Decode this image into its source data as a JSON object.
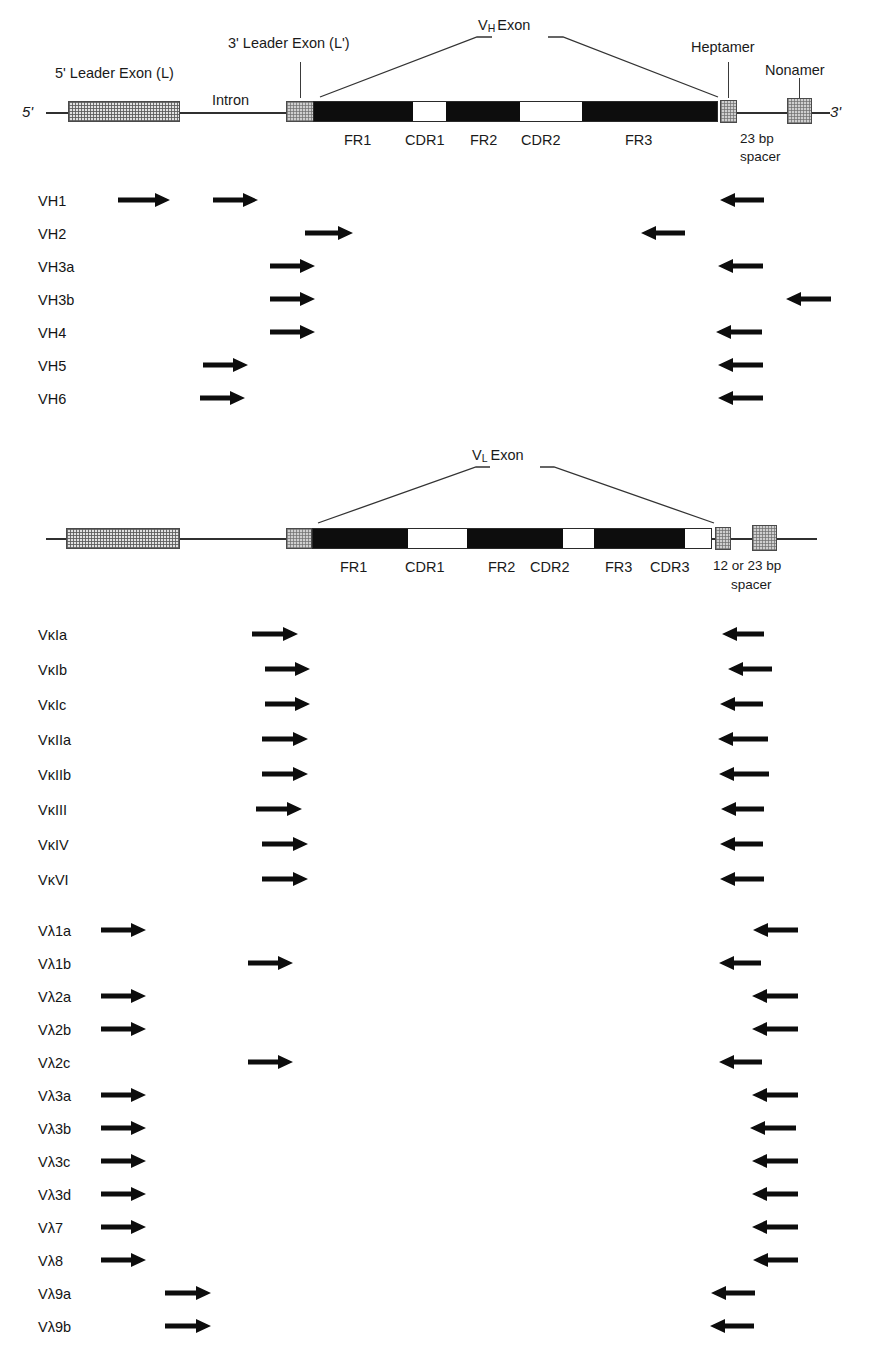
{
  "figure": {
    "ink_color": "#0d0d0d",
    "box_fill": "#d8d8d8"
  },
  "heavy_map": {
    "five_prime_label": "5'",
    "three_prime_label": "3'",
    "leader_exon_label": "5' Leader Exon (L)",
    "intron_label": "Intron",
    "leader_exon2_label": "3' Leader Exon (L')",
    "exon_label_v": "V",
    "exon_label_sub": "H",
    "exon_label_exon": "Exon",
    "heptamer_label": "Heptamer",
    "nonamer_label": "Nonamer",
    "spacer_label_line1": "23 bp",
    "spacer_label_line2": "spacer",
    "segments": [
      "FR1",
      "CDR1",
      "FR2",
      "CDR2",
      "FR3"
    ]
  },
  "light_map": {
    "exon_label_v": "V",
    "exon_label_sub": "L",
    "exon_label_exon": "Exon",
    "spacer_label_line1": "12 or 23 bp",
    "spacer_label_line2": "spacer",
    "segments": [
      "FR1",
      "CDR1",
      "FR2",
      "CDR2",
      "FR3",
      "CDR3"
    ]
  },
  "primer_groups": [
    {
      "name": "heavy-chain-primers",
      "rows": [
        {
          "label": "VH1",
          "forward": [
            {
              "x": 118,
              "w": 52
            },
            {
              "x": 213,
              "w": 45
            }
          ],
          "reverse": [
            {
              "x": 720,
              "w": 44
            }
          ]
        },
        {
          "label": "VH2",
          "forward": [
            {
              "x": 305,
              "w": 48
            }
          ],
          "reverse": [
            {
              "x": 641,
              "w": 44
            }
          ]
        },
        {
          "label": "VH3a",
          "forward": [
            {
              "x": 270,
              "w": 45
            }
          ],
          "reverse": [
            {
              "x": 718,
              "w": 45
            }
          ]
        },
        {
          "label": "VH3b",
          "forward": [
            {
              "x": 270,
              "w": 45
            }
          ],
          "reverse": [
            {
              "x": 786,
              "w": 45
            }
          ]
        },
        {
          "label": "VH4",
          "forward": [
            {
              "x": 270,
              "w": 45
            }
          ],
          "reverse": [
            {
              "x": 716,
              "w": 46
            }
          ]
        },
        {
          "label": "VH5",
          "forward": [
            {
              "x": 203,
              "w": 45
            }
          ],
          "reverse": [
            {
              "x": 718,
              "w": 45
            }
          ]
        },
        {
          "label": "VH6",
          "forward": [
            {
              "x": 200,
              "w": 45
            }
          ],
          "reverse": [
            {
              "x": 718,
              "w": 45
            }
          ]
        }
      ]
    },
    {
      "name": "kappa-chain-primers",
      "rows": [
        {
          "label": "VκIa",
          "forward": [
            {
              "x": 252,
              "w": 46
            }
          ],
          "reverse": [
            {
              "x": 722,
              "w": 42
            }
          ]
        },
        {
          "label": "VκIb",
          "forward": [
            {
              "x": 265,
              "w": 45
            }
          ],
          "reverse": [
            {
              "x": 728,
              "w": 44
            }
          ]
        },
        {
          "label": "VκIc",
          "forward": [
            {
              "x": 265,
              "w": 45
            }
          ],
          "reverse": [
            {
              "x": 720,
              "w": 43
            }
          ]
        },
        {
          "label": "VκIIa",
          "forward": [
            {
              "x": 262,
              "w": 46
            }
          ],
          "reverse": [
            {
              "x": 718,
              "w": 50
            }
          ]
        },
        {
          "label": "VκIIb",
          "forward": [
            {
              "x": 262,
              "w": 46
            }
          ],
          "reverse": [
            {
              "x": 719,
              "w": 50
            }
          ]
        },
        {
          "label": "VκIII",
          "forward": [
            {
              "x": 256,
              "w": 46
            }
          ],
          "reverse": [
            {
              "x": 721,
              "w": 43
            }
          ]
        },
        {
          "label": "VκIV",
          "forward": [
            {
              "x": 262,
              "w": 46
            }
          ],
          "reverse": [
            {
              "x": 720,
              "w": 43
            }
          ]
        },
        {
          "label": "VκVI",
          "forward": [
            {
              "x": 262,
              "w": 46
            }
          ],
          "reverse": [
            {
              "x": 720,
              "w": 44
            }
          ]
        }
      ]
    },
    {
      "name": "lambda-chain-primers",
      "rows": [
        {
          "label": "Vλ1a",
          "forward": [
            {
              "x": 101,
              "w": 45
            }
          ],
          "reverse": [
            {
              "x": 753,
              "w": 45
            }
          ]
        },
        {
          "label": "Vλ1b",
          "forward": [
            {
              "x": 248,
              "w": 45
            }
          ],
          "reverse": [
            {
              "x": 719,
              "w": 42
            }
          ]
        },
        {
          "label": "Vλ2a",
          "forward": [
            {
              "x": 101,
              "w": 45
            }
          ],
          "reverse": [
            {
              "x": 752,
              "w": 46
            }
          ]
        },
        {
          "label": "Vλ2b",
          "forward": [
            {
              "x": 101,
              "w": 45
            }
          ],
          "reverse": [
            {
              "x": 752,
              "w": 46
            }
          ]
        },
        {
          "label": "Vλ2c",
          "forward": [
            {
              "x": 248,
              "w": 45
            }
          ],
          "reverse": [
            {
              "x": 719,
              "w": 43
            }
          ]
        },
        {
          "label": "Vλ3a",
          "forward": [
            {
              "x": 101,
              "w": 45
            }
          ],
          "reverse": [
            {
              "x": 752,
              "w": 46
            }
          ]
        },
        {
          "label": "Vλ3b",
          "forward": [
            {
              "x": 101,
              "w": 45
            }
          ],
          "reverse": [
            {
              "x": 750,
              "w": 46
            }
          ]
        },
        {
          "label": "Vλ3c",
          "forward": [
            {
              "x": 101,
              "w": 45
            }
          ],
          "reverse": [
            {
              "x": 752,
              "w": 46
            }
          ]
        },
        {
          "label": "Vλ3d",
          "forward": [
            {
              "x": 101,
              "w": 45
            }
          ],
          "reverse": [
            {
              "x": 752,
              "w": 46
            }
          ]
        },
        {
          "label": "Vλ7",
          "forward": [
            {
              "x": 101,
              "w": 45
            }
          ],
          "reverse": [
            {
              "x": 752,
              "w": 46
            }
          ]
        },
        {
          "label": "Vλ8",
          "forward": [
            {
              "x": 101,
              "w": 45
            }
          ],
          "reverse": [
            {
              "x": 753,
              "w": 45
            }
          ]
        },
        {
          "label": "Vλ9a",
          "forward": [
            {
              "x": 165,
              "w": 46
            }
          ],
          "reverse": [
            {
              "x": 711,
              "w": 44
            }
          ]
        },
        {
          "label": "Vλ9b",
          "forward": [
            {
              "x": 165,
              "w": 46
            }
          ],
          "reverse": [
            {
              "x": 710,
              "w": 44
            }
          ]
        }
      ]
    }
  ]
}
